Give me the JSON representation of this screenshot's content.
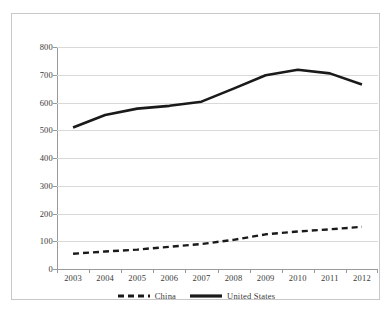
{
  "chart_data": {
    "type": "line",
    "title": "",
    "subtitle": "",
    "xlabel": "",
    "ylabel": "",
    "categories": [
      "2003",
      "2004",
      "2005",
      "2006",
      "2007",
      "2008",
      "2009",
      "2010",
      "2011",
      "2012"
    ],
    "series": [
      {
        "name": "China",
        "style": "dashed",
        "color": "#1a1a1a",
        "values": [
          55,
          63,
          70,
          80,
          90,
          105,
          125,
          135,
          143,
          152
        ]
      },
      {
        "name": "United States",
        "style": "solid",
        "color": "#1a1a1a",
        "values": [
          510,
          555,
          578,
          588,
          603,
          650,
          698,
          718,
          705,
          665
        ]
      }
    ],
    "ylim": [
      0,
      800
    ],
    "y_ticks": [
      0,
      100,
      200,
      300,
      400,
      500,
      600,
      700,
      800
    ],
    "y_tick_labels": [
      "0",
      "100",
      "200",
      "300",
      "400",
      "500",
      "600",
      "700",
      "800"
    ],
    "grid": true,
    "grid_axis": "y",
    "legend_position": "bottom",
    "legend_entries": [
      "China",
      "United States"
    ]
  },
  "colors": {
    "line": "#1a1a1a",
    "gridline": "#d9d9d9",
    "axis": "#9a9a9a",
    "text": "#3a3a3a",
    "frame": "#c8c8c8",
    "background": "#ffffff"
  }
}
